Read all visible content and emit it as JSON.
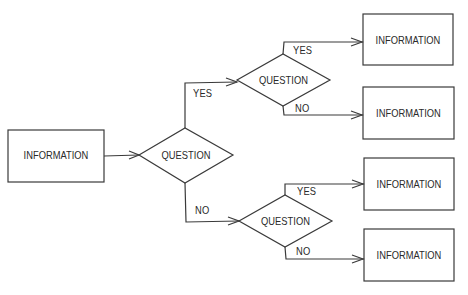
{
  "diagram": {
    "type": "decision-tree-flowchart",
    "colors": {
      "stroke": "#3a3a3a",
      "text": "#2a2a2a",
      "background": "#ffffff"
    },
    "nodes": {
      "start": {
        "shape": "rectangle",
        "label": "INFORMATION"
      },
      "q_main": {
        "shape": "diamond",
        "label": "QUESTION"
      },
      "q_upper": {
        "shape": "diamond",
        "label": "QUESTION"
      },
      "q_lower": {
        "shape": "diamond",
        "label": "QUESTION"
      },
      "out1": {
        "shape": "rectangle",
        "label": "INFORMATION"
      },
      "out2": {
        "shape": "rectangle",
        "label": "INFORMATION"
      },
      "out3": {
        "shape": "rectangle",
        "label": "INFORMATION"
      },
      "out4": {
        "shape": "rectangle",
        "label": "INFORMATION"
      }
    },
    "edges": {
      "main_yes": {
        "from": "q_main",
        "to": "q_upper",
        "label": "YES"
      },
      "main_no": {
        "from": "q_main",
        "to": "q_lower",
        "label": "NO"
      },
      "upper_yes": {
        "from": "q_upper",
        "to": "out1",
        "label": "YES"
      },
      "upper_no": {
        "from": "q_upper",
        "to": "out2",
        "label": "NO"
      },
      "lower_yes": {
        "from": "q_lower",
        "to": "out3",
        "label": "YES"
      },
      "lower_no": {
        "from": "q_lower",
        "to": "out4",
        "label": "NO"
      },
      "start_to_main": {
        "from": "start",
        "to": "q_main",
        "label": ""
      }
    }
  }
}
